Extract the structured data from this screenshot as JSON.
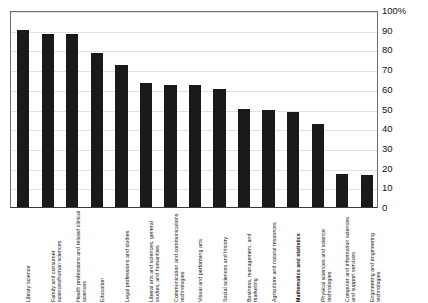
{
  "chart_data": {
    "type": "bar",
    "title": "",
    "subtitle": "",
    "xlabel": "",
    "ylabel": "",
    "ylim": [
      0,
      100
    ],
    "grid": true,
    "legend": "none",
    "y_axis_position": "right",
    "x_tick_rotation": -90,
    "bar_color": "#1a1a1a",
    "gridline_color": "#e2e2e2",
    "axis_color": "#6e6e6e",
    "background_color": "#ffffff",
    "yticks": [
      "0",
      "10",
      "20",
      "30",
      "40",
      "50",
      "60",
      "70",
      "80",
      "90",
      "100%"
    ],
    "ytick_values": [
      0,
      10,
      20,
      30,
      40,
      50,
      60,
      70,
      80,
      90,
      100
    ],
    "highlighted_category": "Mathematics and statistics",
    "categories": [
      "Library science",
      "Family and consumer sciences/human sciences",
      "Health professions and related clinical sciences",
      "Education",
      "Legal professions and studies",
      "Liberal arts and sciences, general studies, and humanities",
      "Communication and communications technologies",
      "Visual and performing arts",
      "Social sciences and history",
      "Business, management, and marketing",
      "Agriculture and natural resources",
      "Mathematics and statistics",
      "Physical sciences and science technologies",
      "Computer and information sciences and support services",
      "Engineering and engineering technologies"
    ],
    "values": [
      90,
      88,
      88,
      78,
      72,
      63,
      62,
      62,
      60,
      50,
      49,
      48,
      42,
      17,
      16
    ]
  }
}
